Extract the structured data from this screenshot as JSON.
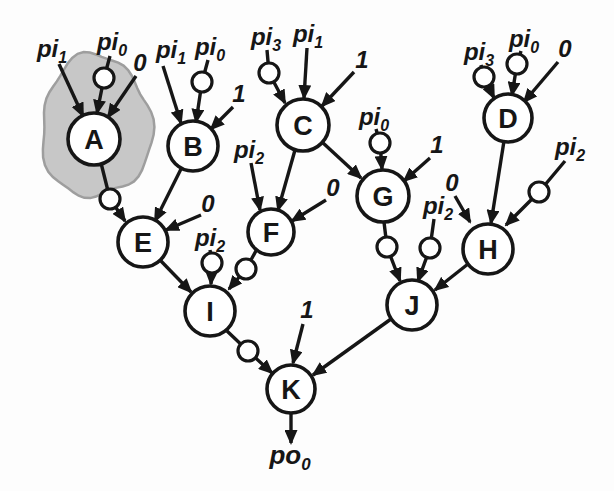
{
  "figure": {
    "width": 614,
    "height": 491,
    "background": "#fdfdfd",
    "ink": "#161616",
    "node_fill": "#ffffff",
    "highlight": {
      "target_node": "A",
      "fill": "#c7c7c7",
      "stroke": "#9e9e9e",
      "cx": 96,
      "cy": 127,
      "rx": 55,
      "ry": 71
    }
  },
  "diagram": {
    "type": "logic-network-dag",
    "output_label": {
      "main": "po",
      "sub": "0",
      "x": 290,
      "y": 464
    },
    "nodes": [
      {
        "id": "A",
        "label": "A",
        "x": 94,
        "y": 139,
        "r": 26,
        "highlighted": true
      },
      {
        "id": "B",
        "label": "B",
        "x": 193,
        "y": 146,
        "r": 25,
        "highlighted": false
      },
      {
        "id": "C",
        "label": "C",
        "x": 303,
        "y": 125,
        "r": 26,
        "highlighted": false
      },
      {
        "id": "D",
        "label": "D",
        "x": 508,
        "y": 118,
        "r": 24,
        "highlighted": false
      },
      {
        "id": "E",
        "label": "E",
        "x": 143,
        "y": 242,
        "r": 25,
        "highlighted": false
      },
      {
        "id": "F",
        "label": "F",
        "x": 271,
        "y": 232,
        "r": 23,
        "highlighted": false
      },
      {
        "id": "G",
        "label": "G",
        "x": 383,
        "y": 196,
        "r": 26,
        "highlighted": false
      },
      {
        "id": "H",
        "label": "H",
        "x": 488,
        "y": 249,
        "r": 25,
        "highlighted": false
      },
      {
        "id": "I",
        "label": "I",
        "x": 210,
        "y": 311,
        "r": 25,
        "highlighted": false
      },
      {
        "id": "J",
        "label": "J",
        "x": 412,
        "y": 305,
        "r": 25,
        "highlighted": false
      },
      {
        "id": "K",
        "label": "K",
        "x": 291,
        "y": 389,
        "r": 24,
        "highlighted": false
      }
    ],
    "input_labels": [
      {
        "id": "a-pi1",
        "main": "pi",
        "sub": "1",
        "x": 52,
        "y": 57
      },
      {
        "id": "a-pi0",
        "main": "pi",
        "sub": "0",
        "x": 112,
        "y": 50
      },
      {
        "id": "a-c0",
        "main": "0",
        "sub": "",
        "x": 140,
        "y": 71
      },
      {
        "id": "b-pi1",
        "main": "pi",
        "sub": "1",
        "x": 171,
        "y": 58
      },
      {
        "id": "b-pi0",
        "main": "pi",
        "sub": "0",
        "x": 210,
        "y": 55
      },
      {
        "id": "b-c1",
        "main": "1",
        "sub": "",
        "x": 239,
        "y": 102
      },
      {
        "id": "c-pi3",
        "main": "pi",
        "sub": "3",
        "x": 266,
        "y": 45
      },
      {
        "id": "c-pi1",
        "main": "pi",
        "sub": "1",
        "x": 308,
        "y": 42
      },
      {
        "id": "c-c1",
        "main": "1",
        "sub": "",
        "x": 362,
        "y": 68
      },
      {
        "id": "d-pi3",
        "main": "pi",
        "sub": "3",
        "x": 479,
        "y": 60
      },
      {
        "id": "d-pi0",
        "main": "pi",
        "sub": "0",
        "x": 524,
        "y": 47
      },
      {
        "id": "d-c0",
        "main": "0",
        "sub": "",
        "x": 565,
        "y": 57
      },
      {
        "id": "e-c0",
        "main": "0",
        "sub": "",
        "x": 208,
        "y": 212
      },
      {
        "id": "f-pi2",
        "main": "pi",
        "sub": "2",
        "x": 249,
        "y": 158
      },
      {
        "id": "f-c0",
        "main": "0",
        "sub": "",
        "x": 333,
        "y": 196
      },
      {
        "id": "g-pi0",
        "main": "pi",
        "sub": "0",
        "x": 374,
        "y": 125
      },
      {
        "id": "g-c1",
        "main": "1",
        "sub": "",
        "x": 437,
        "y": 153
      },
      {
        "id": "h-c0",
        "main": "0",
        "sub": "",
        "x": 452,
        "y": 191
      },
      {
        "id": "h-pi2",
        "main": "pi",
        "sub": "2",
        "x": 570,
        "y": 155
      },
      {
        "id": "i-pi2",
        "main": "pi",
        "sub": "2",
        "x": 210,
        "y": 246
      },
      {
        "id": "j-pi2",
        "main": "pi",
        "sub": "2",
        "x": 438,
        "y": 214
      },
      {
        "id": "k-c1",
        "main": "1",
        "sub": "",
        "x": 307,
        "y": 318
      }
    ],
    "edges": [
      {
        "from": "pi1",
        "to": "A",
        "inverted": false,
        "points": [
          [
            59,
            64
          ],
          [
            83,
            116
          ]
        ],
        "bubble": null
      },
      {
        "from": "pi0",
        "to": "A",
        "inverted": true,
        "points": [
          [
            110,
            56
          ],
          [
            104,
            78
          ],
          [
            97,
            113
          ]
        ],
        "bubble": [
          104,
          78
        ]
      },
      {
        "from": "0",
        "to": "A",
        "inverted": false,
        "points": [
          [
            136,
            76
          ],
          [
            108,
            117
          ]
        ],
        "bubble": null
      },
      {
        "from": "pi1",
        "to": "B",
        "inverted": false,
        "points": [
          [
            163,
            66
          ],
          [
            181,
            123
          ]
        ],
        "bubble": null
      },
      {
        "from": "pi0",
        "to": "B",
        "inverted": true,
        "points": [
          [
            208,
            60
          ],
          [
            202,
            82
          ],
          [
            196,
            122
          ]
        ],
        "bubble": [
          202,
          82
        ]
      },
      {
        "from": "1",
        "to": "B",
        "inverted": false,
        "points": [
          [
            233,
            107
          ],
          [
            211,
            129
          ]
        ],
        "bubble": null
      },
      {
        "from": "pi3",
        "to": "C",
        "inverted": true,
        "points": [
          [
            267,
            50
          ],
          [
            269,
            73
          ],
          [
            285,
            103
          ]
        ],
        "bubble": [
          269,
          73
        ]
      },
      {
        "from": "pi1",
        "to": "C",
        "inverted": false,
        "points": [
          [
            307,
            48
          ],
          [
            304,
            98
          ]
        ],
        "bubble": null
      },
      {
        "from": "1",
        "to": "C",
        "inverted": false,
        "points": [
          [
            354,
            72
          ],
          [
            322,
            106
          ]
        ],
        "bubble": null
      },
      {
        "from": "pi3",
        "to": "D",
        "inverted": true,
        "points": [
          [
            481,
            65
          ],
          [
            484,
            77
          ],
          [
            494,
            98
          ]
        ],
        "bubble": [
          484,
          77
        ]
      },
      {
        "from": "pi0",
        "to": "D",
        "inverted": true,
        "points": [
          [
            521,
            51
          ],
          [
            517,
            64
          ],
          [
            512,
            95
          ]
        ],
        "bubble": [
          517,
          64
        ]
      },
      {
        "from": "0",
        "to": "D",
        "inverted": false,
        "points": [
          [
            558,
            62
          ],
          [
            524,
            102
          ]
        ],
        "bubble": null
      },
      {
        "from": "A",
        "to": "E",
        "inverted": true,
        "points": [
          [
            101,
            163
          ],
          [
            110,
            199
          ],
          [
            125,
            221
          ]
        ],
        "bubble": [
          110,
          199
        ]
      },
      {
        "from": "B",
        "to": "E",
        "inverted": false,
        "points": [
          [
            181,
            169
          ],
          [
            155,
            221
          ]
        ],
        "bubble": null
      },
      {
        "from": "0",
        "to": "E",
        "inverted": false,
        "points": [
          [
            201,
            215
          ],
          [
            166,
            230
          ]
        ],
        "bubble": null
      },
      {
        "from": "pi2",
        "to": "F",
        "inverted": false,
        "points": [
          [
            251,
            163
          ],
          [
            260,
            210
          ]
        ],
        "bubble": null
      },
      {
        "from": "C",
        "to": "F",
        "inverted": false,
        "points": [
          [
            295,
            150
          ],
          [
            278,
            210
          ]
        ],
        "bubble": null
      },
      {
        "from": "0",
        "to": "F",
        "inverted": false,
        "points": [
          [
            326,
            200
          ],
          [
            292,
            221
          ]
        ],
        "bubble": null
      },
      {
        "from": "C",
        "to": "G",
        "inverted": false,
        "points": [
          [
            322,
            142
          ],
          [
            361,
            178
          ]
        ],
        "bubble": null
      },
      {
        "from": "pi0",
        "to": "G",
        "inverted": true,
        "points": [
          [
            376,
            129
          ],
          [
            380,
            143
          ],
          [
            382,
            169
          ]
        ],
        "bubble": [
          380,
          143
        ]
      },
      {
        "from": "1",
        "to": "G",
        "inverted": false,
        "points": [
          [
            430,
            158
          ],
          [
            404,
            181
          ]
        ],
        "bubble": null
      },
      {
        "from": "0",
        "to": "H",
        "inverted": false,
        "points": [
          [
            455,
            196
          ],
          [
            470,
            222
          ]
        ],
        "bubble": null
      },
      {
        "from": "D",
        "to": "H",
        "inverted": false,
        "points": [
          [
            504,
            141
          ],
          [
            491,
            223
          ]
        ],
        "bubble": null
      },
      {
        "from": "pi2",
        "to": "H",
        "inverted": true,
        "points": [
          [
            565,
            161
          ],
          [
            539,
            192
          ],
          [
            506,
            225
          ]
        ],
        "bubble": [
          539,
          192
        ]
      },
      {
        "from": "E",
        "to": "I",
        "inverted": false,
        "points": [
          [
            160,
            260
          ],
          [
            191,
            292
          ]
        ],
        "bubble": null
      },
      {
        "from": "pi2",
        "to": "I",
        "inverted": true,
        "points": [
          [
            210,
            250
          ],
          [
            212,
            263
          ],
          [
            211,
            284
          ]
        ],
        "bubble": [
          212,
          263
        ]
      },
      {
        "from": "F",
        "to": "I",
        "inverted": true,
        "points": [
          [
            257,
            249
          ],
          [
            246,
            269
          ],
          [
            229,
            289
          ]
        ],
        "bubble": [
          246,
          269
        ]
      },
      {
        "from": "G",
        "to": "J",
        "inverted": true,
        "points": [
          [
            384,
            222
          ],
          [
            387,
            247
          ],
          [
            400,
            281
          ]
        ],
        "bubble": [
          387,
          247
        ]
      },
      {
        "from": "pi2",
        "to": "J",
        "inverted": true,
        "points": [
          [
            434,
            219
          ],
          [
            430,
            248
          ],
          [
            418,
            281
          ]
        ],
        "bubble": [
          430,
          248
        ]
      },
      {
        "from": "H",
        "to": "J",
        "inverted": false,
        "points": [
          [
            468,
            264
          ],
          [
            435,
            290
          ]
        ],
        "bubble": null
      },
      {
        "from": "I",
        "to": "K",
        "inverted": true,
        "points": [
          [
            227,
            331
          ],
          [
            248,
            351
          ],
          [
            272,
            373
          ]
        ],
        "bubble": [
          248,
          351
        ]
      },
      {
        "from": "1",
        "to": "K",
        "inverted": false,
        "points": [
          [
            303,
            324
          ],
          [
            293,
            363
          ]
        ],
        "bubble": null
      },
      {
        "from": "J",
        "to": "K",
        "inverted": false,
        "points": [
          [
            391,
            319
          ],
          [
            313,
            375
          ]
        ],
        "bubble": null
      },
      {
        "from": "K",
        "to": "po0",
        "inverted": false,
        "points": [
          [
            291,
            413
          ],
          [
            291,
            443
          ]
        ],
        "bubble": null
      }
    ]
  }
}
